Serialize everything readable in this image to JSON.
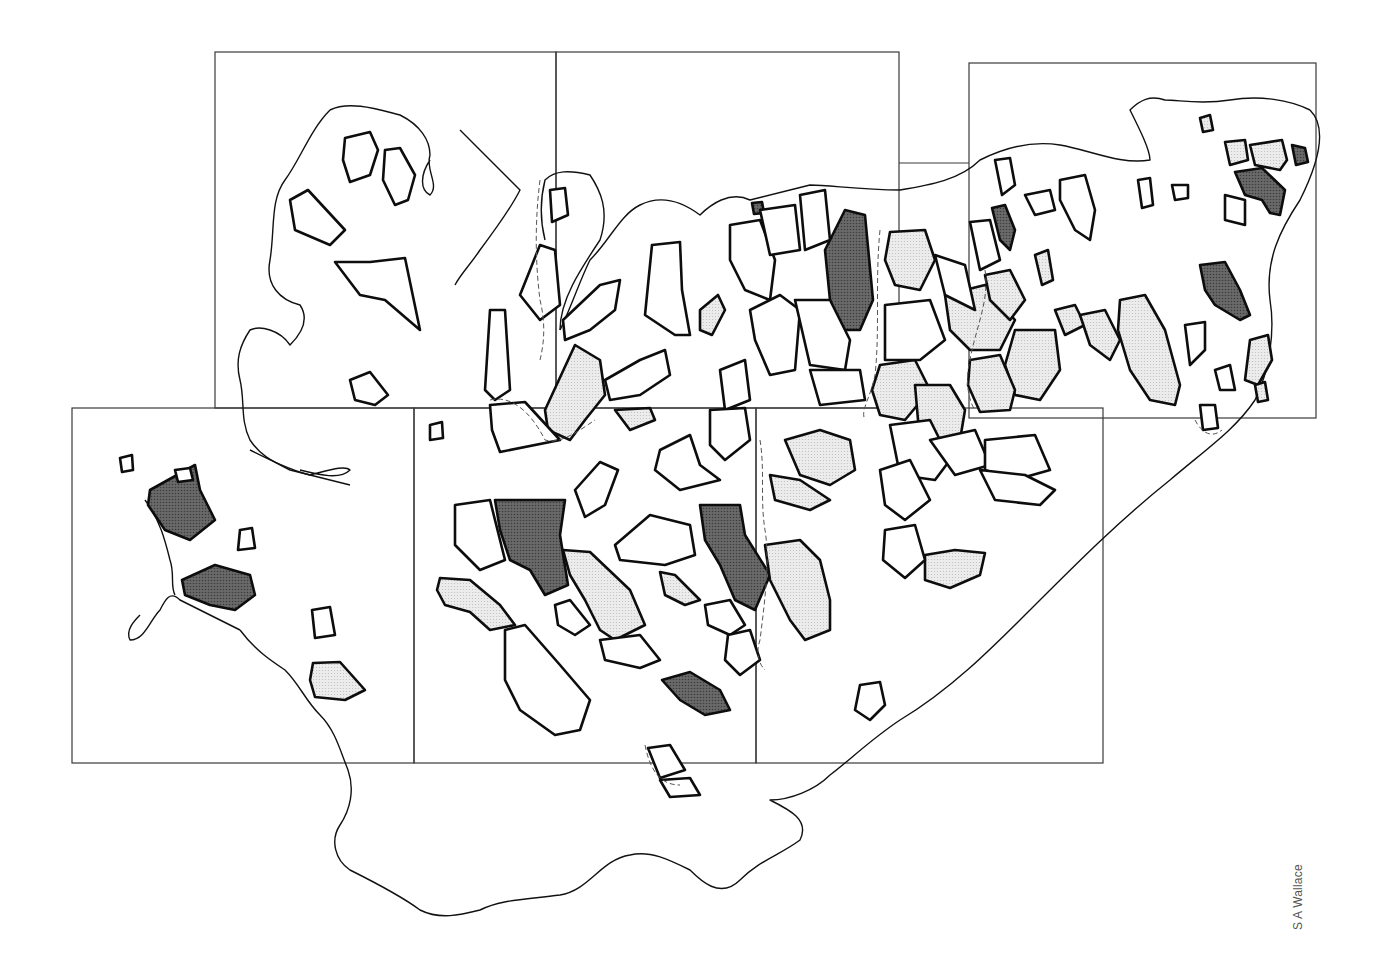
{
  "credit": "S A Wallace",
  "colors": {
    "background": "#ffffff",
    "outline": "#0d0d0d",
    "light_fill": "#e4e4e4",
    "dark_fill": "#5f5f5f",
    "frame": "#3a3a3a"
  },
  "legend_categories": [
    {
      "name": "unshaded",
      "fill": "#ffffff"
    },
    {
      "name": "light-stipple",
      "fill": "#e4e4e4"
    },
    {
      "name": "dark-stipple",
      "fill": "#5f5f5f"
    }
  ],
  "map_sheets": [
    {
      "id": "sheet-1",
      "x": 215,
      "y": 52,
      "w": 341,
      "h": 356
    },
    {
      "id": "sheet-2",
      "x": 556,
      "y": 52,
      "w": 343,
      "h": 356
    },
    {
      "id": "sheet-3",
      "x": 969,
      "y": 63,
      "w": 347,
      "h": 355
    },
    {
      "id": "sheet-4",
      "x": 72,
      "y": 408,
      "w": 342,
      "h": 355
    },
    {
      "id": "sheet-5",
      "x": 414,
      "y": 408,
      "w": 342,
      "h": 355
    },
    {
      "id": "sheet-6",
      "x": 756,
      "y": 408,
      "w": 347,
      "h": 355
    }
  ]
}
